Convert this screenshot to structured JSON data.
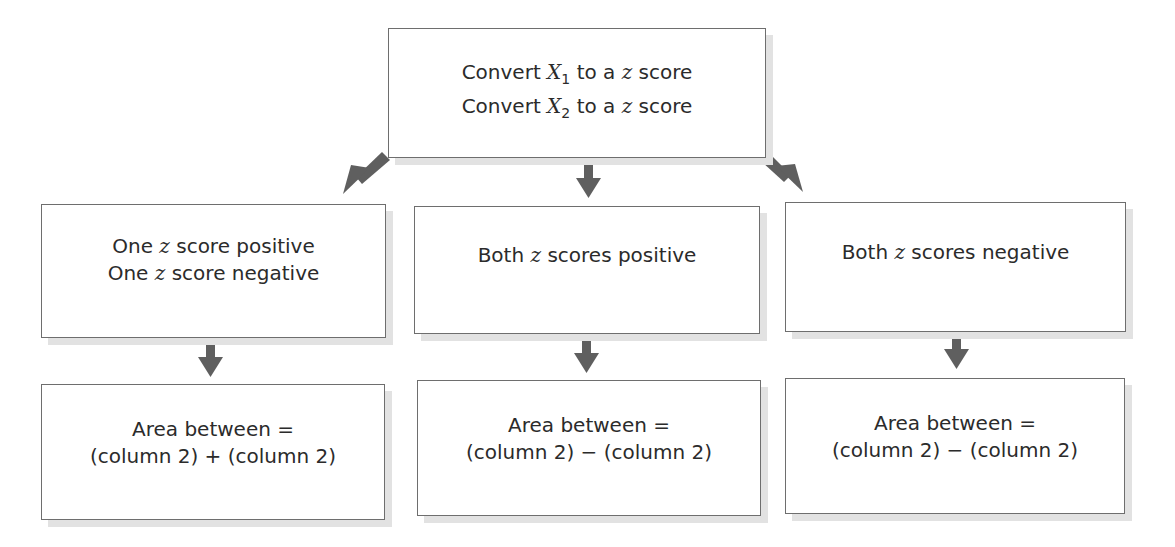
{
  "diagram": {
    "top": {
      "lines": [
        "Convert X1 to a z score",
        "Convert X2 to a z score"
      ],
      "line1": {
        "pre": "Convert ",
        "var": "X",
        "sub": "1",
        "mid": " to a ",
        "z": "z",
        "post": " score"
      },
      "line2": {
        "pre": "Convert ",
        "var": "X",
        "sub": "2",
        "mid": " to a ",
        "z": "z",
        "post": " score"
      }
    },
    "cases": [
      {
        "condition": {
          "line1": {
            "a": "One ",
            "z": "z",
            "b": " score positive"
          },
          "line2": {
            "a": "One ",
            "z": "z",
            "b": " score negative"
          }
        },
        "result": {
          "line1": "Area between =",
          "line2": "(column 2) + (column 2)"
        }
      },
      {
        "condition": {
          "line1": {
            "a": "Both ",
            "z": "z",
            "b": " scores positive"
          }
        },
        "result": {
          "line1": "Area between =",
          "line2": "(column 2) − (column 2)"
        }
      },
      {
        "condition": {
          "line1": {
            "a": "Both ",
            "z": "z",
            "b": " scores negative"
          }
        },
        "result": {
          "line1": "Area between =",
          "line2": "(column 2) − (column 2)"
        }
      }
    ],
    "colors": {
      "arrow": "#5f5f5f",
      "border": "#6e6e6e",
      "shadow": "#e2e2e2"
    }
  }
}
